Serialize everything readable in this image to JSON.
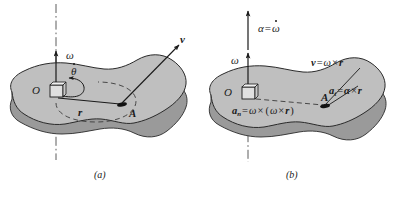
{
  "figure": {
    "type": "engineering-mechanics-diagram",
    "body_fill": "#bfbfbf",
    "body_edge_fill": "#9a9a9a",
    "stroke": "#1a1a1a",
    "background": "#ffffff"
  },
  "panel_a": {
    "caption": "(a)",
    "labels": {
      "omega": "ω",
      "origin": "O",
      "theta_dot": "θ",
      "r": "r",
      "point_a": "A",
      "v": "v"
    },
    "axis": {
      "style": "dash-dot",
      "orientation": "vertical"
    },
    "arrows": [
      {
        "name": "omega-arrow",
        "from": [
          56,
          95
        ],
        "to": [
          56,
          50
        ]
      },
      {
        "name": "velocity-arrow",
        "from": [
          122,
          103
        ],
        "to": [
          178,
          46
        ]
      },
      {
        "name": "theta-dot-arc",
        "type": "curved-arrow"
      }
    ]
  },
  "panel_b": {
    "caption": "(b)",
    "labels": {
      "alpha_eq_omega_dot_left": "α",
      "alpha_eq_omega_dot_eq": "=",
      "alpha_eq_omega_dot_right": "ω",
      "omega": "ω",
      "origin": "O",
      "point_a": "A",
      "v_sym": "v",
      "v_eq": "=",
      "v_omega": "ω",
      "v_cross": "×",
      "v_r": "r",
      "at_sym": "a",
      "at_sub": "t",
      "at_eq": "=",
      "at_alpha": "α",
      "at_cross": "×",
      "at_r": "r",
      "an_sym": "a",
      "an_sub": "n",
      "an_eq": "=",
      "an_omega1": "ω",
      "an_cross1": "×",
      "an_open": "(",
      "an_omega2": "ω",
      "an_cross2": "×",
      "an_r": "r",
      "an_close": ")"
    },
    "axis": {
      "style": "dash-dot",
      "orientation": "vertical"
    },
    "arrows": [
      {
        "name": "alpha-arrow",
        "from": [
          248,
          48
        ],
        "to": [
          248,
          12
        ]
      },
      {
        "name": "omega-arrow",
        "from": [
          248,
          95
        ],
        "to": [
          248,
          52
        ]
      },
      {
        "name": "v-leader",
        "type": "leader-line"
      },
      {
        "name": "at-leader",
        "type": "leader-line"
      }
    ]
  }
}
